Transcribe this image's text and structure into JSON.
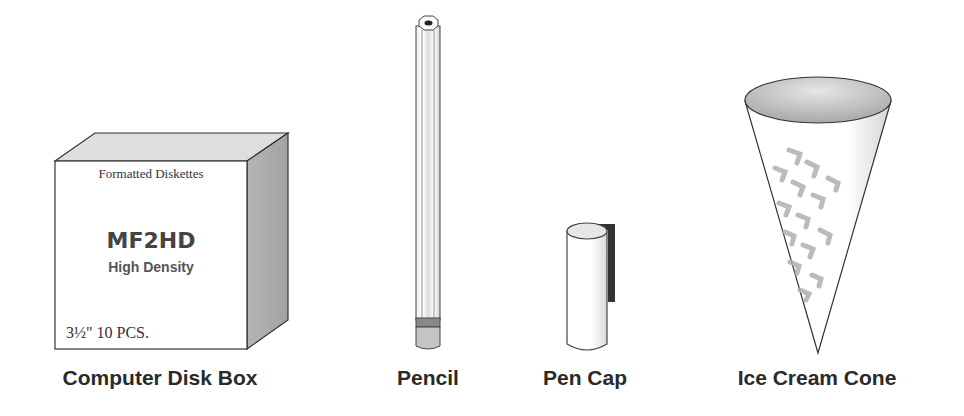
{
  "objects": [
    {
      "id": "disk-box",
      "label": "Computer Disk Box",
      "box_text": {
        "header": "Formatted Diskettes",
        "brand": "MF2HD",
        "subtitle": "High Density",
        "count": "3½\" 10 PCS."
      }
    },
    {
      "id": "pencil",
      "label": "Pencil"
    },
    {
      "id": "pen-cap",
      "label": "Pen Cap"
    },
    {
      "id": "ice-cream-cone",
      "label": "Ice Cream Cone"
    }
  ],
  "colors": {
    "outline": "#333333",
    "label_text": "#2a2a2a",
    "shade_light": "#e4e4e4",
    "shade_mid": "#bdbdbd",
    "shade_dark": "#9a9a9a"
  }
}
